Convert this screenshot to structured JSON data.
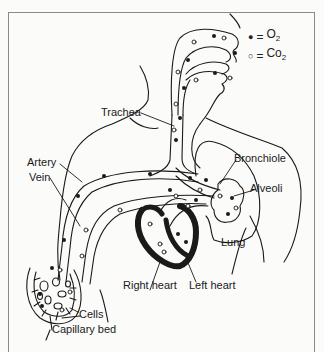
{
  "legend": {
    "o2": {
      "symbol": "●",
      "eq": "=",
      "label": "O",
      "sub": "2"
    },
    "co2": {
      "symbol": "○",
      "eq": "=",
      "label": "Co",
      "sub": "2"
    }
  },
  "labels": {
    "trachea": "Trachea",
    "artery": "Artery",
    "vein": "Vein",
    "bronchiole": "Bronchiole",
    "alveoli": "Alveoli",
    "lung": "Lung",
    "right_heart": "Right heart",
    "left_heart": "Left heart",
    "cells": "Cells",
    "capillary_bed": "Capillary bed"
  },
  "colors": {
    "line": "#1a1a1a",
    "frame": "#8a8a8a",
    "background": "#fbfbf9"
  }
}
